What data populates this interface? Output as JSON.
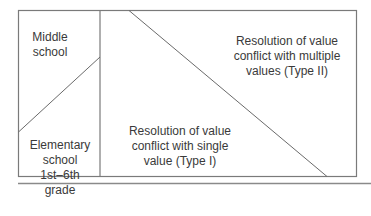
{
  "diagram": {
    "regions": {
      "middle_school": {
        "lines": [
          "Middle",
          "school"
        ]
      },
      "elementary_school": {
        "lines": [
          "Elementary",
          "school",
          "1st–6th",
          "grade"
        ]
      },
      "type_one": {
        "lines": [
          "Resolution of value",
          "conflict with single",
          "value (Type I)"
        ]
      },
      "type_two": {
        "lines": [
          "Resolution of value",
          "conflict with multiple",
          "values (Type II)"
        ]
      }
    },
    "colors": {
      "line": "#7a7a7a",
      "text": "#3a3a3a",
      "background": "#ffffff"
    }
  }
}
